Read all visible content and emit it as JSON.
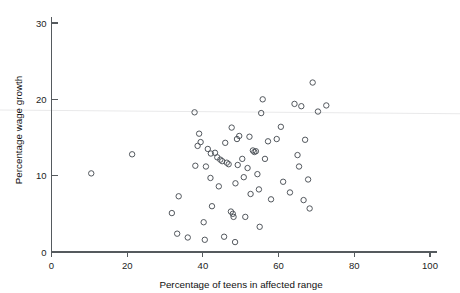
{
  "chart_data": {
    "type": "scatter",
    "title": "",
    "xlabel": "Percentage of teens in affected range",
    "ylabel": "Percentage wage growth",
    "xlim": [
      0,
      100
    ],
    "ylim": [
      0,
      30
    ],
    "xticks": [
      0,
      20,
      40,
      60,
      80,
      100
    ],
    "yticks": [
      0,
      10,
      20,
      30
    ],
    "xtick_labels": [
      "0",
      "20",
      "40",
      "60",
      "80",
      "100"
    ],
    "ytick_labels": [
      "0",
      "10",
      "20",
      "30"
    ],
    "grid": false,
    "legend": null,
    "marker": "open-circle",
    "marker_color": "#4a4f55",
    "background_color": "#ffffff",
    "axis_color": "#555a5e",
    "trend_line": {
      "visible": true,
      "color": "#e9e9ea",
      "x": [
        0,
        100
      ],
      "y": [
        18.6,
        18.1
      ]
    },
    "points": [
      {
        "x": 10.5,
        "y": 10.3
      },
      {
        "x": 21.3,
        "y": 12.8
      },
      {
        "x": 31.8,
        "y": 5.1
      },
      {
        "x": 33.2,
        "y": 2.4
      },
      {
        "x": 33.6,
        "y": 7.3
      },
      {
        "x": 36.0,
        "y": 1.9
      },
      {
        "x": 37.8,
        "y": 18.3
      },
      {
        "x": 38.0,
        "y": 11.3
      },
      {
        "x": 38.6,
        "y": 13.9
      },
      {
        "x": 39.0,
        "y": 15.5
      },
      {
        "x": 39.4,
        "y": 14.4
      },
      {
        "x": 40.2,
        "y": 3.9
      },
      {
        "x": 40.5,
        "y": 1.6
      },
      {
        "x": 40.8,
        "y": 11.2
      },
      {
        "x": 41.3,
        "y": 13.5
      },
      {
        "x": 42.0,
        "y": 9.7
      },
      {
        "x": 42.1,
        "y": 12.9
      },
      {
        "x": 42.4,
        "y": 6.0
      },
      {
        "x": 43.2,
        "y": 13.0
      },
      {
        "x": 43.8,
        "y": 12.4
      },
      {
        "x": 44.2,
        "y": 8.6
      },
      {
        "x": 44.6,
        "y": 12.1
      },
      {
        "x": 45.1,
        "y": 11.9
      },
      {
        "x": 45.6,
        "y": 2.0
      },
      {
        "x": 45.9,
        "y": 14.3
      },
      {
        "x": 46.3,
        "y": 11.7
      },
      {
        "x": 46.8,
        "y": 11.5
      },
      {
        "x": 47.4,
        "y": 5.3
      },
      {
        "x": 47.6,
        "y": 16.3
      },
      {
        "x": 47.9,
        "y": 5.0
      },
      {
        "x": 48.1,
        "y": 4.6
      },
      {
        "x": 48.5,
        "y": 1.3
      },
      {
        "x": 48.6,
        "y": 9.0
      },
      {
        "x": 49.0,
        "y": 14.8
      },
      {
        "x": 49.2,
        "y": 11.4
      },
      {
        "x": 49.6,
        "y": 15.2
      },
      {
        "x": 50.4,
        "y": 12.2
      },
      {
        "x": 50.8,
        "y": 9.8
      },
      {
        "x": 51.2,
        "y": 4.6
      },
      {
        "x": 51.8,
        "y": 11.0
      },
      {
        "x": 52.3,
        "y": 15.1
      },
      {
        "x": 52.6,
        "y": 7.6
      },
      {
        "x": 53.2,
        "y": 13.3
      },
      {
        "x": 53.6,
        "y": 13.1
      },
      {
        "x": 54.0,
        "y": 13.2
      },
      {
        "x": 54.4,
        "y": 10.2
      },
      {
        "x": 54.8,
        "y": 8.2
      },
      {
        "x": 55.0,
        "y": 3.3
      },
      {
        "x": 55.4,
        "y": 18.2
      },
      {
        "x": 55.8,
        "y": 20.0
      },
      {
        "x": 56.4,
        "y": 12.2
      },
      {
        "x": 57.2,
        "y": 14.5
      },
      {
        "x": 58.0,
        "y": 6.9
      },
      {
        "x": 59.5,
        "y": 14.8
      },
      {
        "x": 60.6,
        "y": 16.4
      },
      {
        "x": 61.2,
        "y": 9.2
      },
      {
        "x": 63.0,
        "y": 7.8
      },
      {
        "x": 64.2,
        "y": 19.4
      },
      {
        "x": 65.0,
        "y": 12.7
      },
      {
        "x": 65.4,
        "y": 11.2
      },
      {
        "x": 66.0,
        "y": 19.1
      },
      {
        "x": 66.6,
        "y": 6.8
      },
      {
        "x": 67.0,
        "y": 14.7
      },
      {
        "x": 67.8,
        "y": 9.5
      },
      {
        "x": 68.2,
        "y": 5.7
      },
      {
        "x": 69.0,
        "y": 22.2
      },
      {
        "x": 70.4,
        "y": 18.4
      },
      {
        "x": 72.6,
        "y": 19.2
      }
    ]
  }
}
